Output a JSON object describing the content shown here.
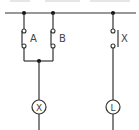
{
  "diagram": {
    "type": "ladder-circuit",
    "colors": {
      "wire": "#333333",
      "background": "#ffffff"
    },
    "switches": [
      {
        "id": "A",
        "label": "A",
        "type": "normally-open"
      },
      {
        "id": "B",
        "label": "B",
        "type": "normally-open"
      },
      {
        "id": "X",
        "label": "X",
        "type": "normally-open-relay-contact"
      }
    ],
    "loads": [
      {
        "id": "X",
        "label": "X",
        "type": "relay-coil"
      },
      {
        "id": "L",
        "label": "L",
        "type": "lamp"
      }
    ]
  }
}
